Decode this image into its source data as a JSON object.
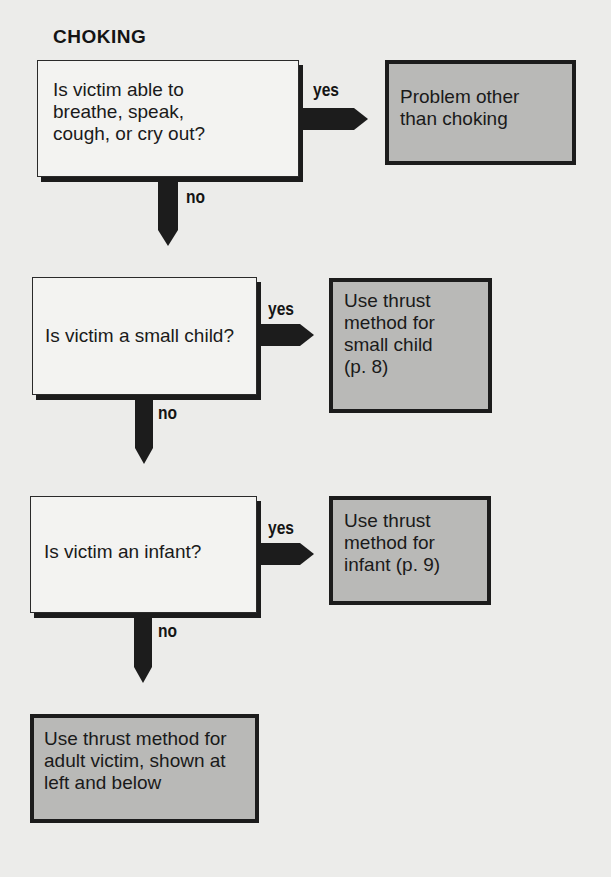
{
  "title": "CHOKING",
  "colors": {
    "question_fill": "#f3f3f1",
    "answer_fill": "#b9b9b7",
    "arrow": "#1c1c1c",
    "background": "#ececea"
  },
  "labels": {
    "yes": "yes",
    "no": "no"
  },
  "steps": [
    {
      "question": [
        "Is victim able to",
        "breathe, speak,",
        "cough, or cry out?"
      ],
      "yes_result": [
        "Problem other",
        "than choking"
      ]
    },
    {
      "question": [
        "Is victim a small child?"
      ],
      "yes_result": [
        "Use thrust",
        "method for",
        "small child",
        "(p. 8)"
      ]
    },
    {
      "question": [
        "Is victim an infant?"
      ],
      "yes_result": [
        "Use thrust",
        "method for",
        "infant (p. 9)"
      ]
    }
  ],
  "final_result": [
    "Use thrust method for",
    "adult victim, shown at",
    "left and below"
  ]
}
